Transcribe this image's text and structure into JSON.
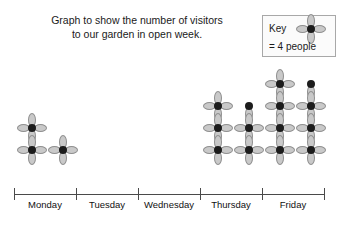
{
  "chart_data": {
    "type": "bar",
    "chart_style": "pictogram",
    "title": "Graph to show the number of visitors to our garden in open week.",
    "title_lines": [
      "Graph to show the number of visitors",
      "to our garden in open week."
    ],
    "xlabel": "",
    "ylabel": "",
    "grid": false,
    "legend_position": "top-right",
    "key": {
      "label": "Key",
      "value_text": "= 4 people",
      "icon": "flower-icon",
      "people_per_icon": 4
    },
    "categories": [
      "Monday",
      "Tuesday",
      "Wednesday",
      "Thursday",
      "Friday"
    ],
    "icon_counts": [
      3,
      0,
      0,
      5.5,
      7.5
    ],
    "values": [
      12,
      0,
      0,
      22,
      30
    ],
    "columns": [
      {
        "day": "Monday",
        "stacks": [
          {
            "full": 2,
            "partial": 0
          },
          {
            "full": 1,
            "partial": 0
          }
        ]
      },
      {
        "day": "Tuesday",
        "stacks": [
          {
            "full": 0,
            "partial": 0
          },
          {
            "full": 0,
            "partial": 0
          }
        ]
      },
      {
        "day": "Wednesday",
        "stacks": [
          {
            "full": 0,
            "partial": 0
          },
          {
            "full": 0,
            "partial": 0
          }
        ]
      },
      {
        "day": "Thursday",
        "stacks": [
          {
            "full": 3,
            "partial": 0
          },
          {
            "full": 2,
            "partial": 1
          }
        ]
      },
      {
        "day": "Friday",
        "stacks": [
          {
            "full": 4,
            "partial": 0
          },
          {
            "full": 3,
            "partial": 1
          }
        ]
      }
    ],
    "axis": {
      "tick_positions_px": [
        14,
        76,
        138,
        200,
        262,
        324
      ],
      "baseline_y_px": 194
    }
  },
  "colors": {
    "petal_fill": "#c9c9c9",
    "petal_stroke": "#8f8f8f",
    "flower_core": "#1c1c1c",
    "axis": "#4a4a4a",
    "key_border": "#a8a8a8",
    "key_background": "#fbfbfb",
    "text": "#111111",
    "background": "#ffffff"
  }
}
